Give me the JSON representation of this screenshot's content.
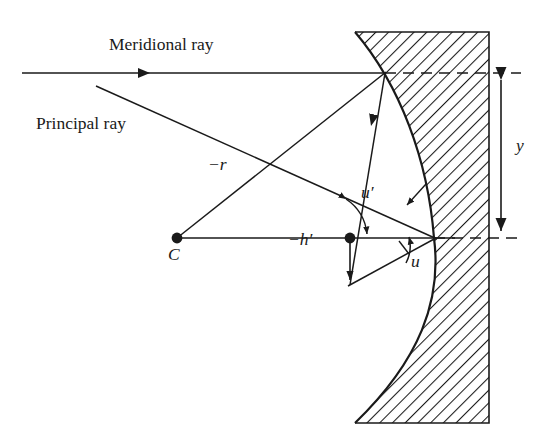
{
  "figure": {
    "domain_type": "optical ray diagram",
    "canvas": {
      "width": 550,
      "height": 445
    },
    "colors": {
      "ink": "#1a1a1a",
      "background": "#ffffff",
      "hatch": "#1a1a1a"
    }
  },
  "labels": {
    "meridional_ray": "Meridional ray",
    "principal_ray": "Principal ray",
    "radius": "−r",
    "object_height": "−h′",
    "angle_u_prime": "u′",
    "angle_u": "u",
    "center_of_curvature": "C",
    "ray_height": "y"
  },
  "geometry": {
    "optical_axis": {
      "x1": 177,
      "y1": 238,
      "x2": 455,
      "y2": 238
    },
    "meridional_ray_incoming": {
      "x1": 22,
      "y1": 73,
      "x2": 385,
      "y2": 73
    },
    "meridional_ray_arrowhead": {
      "x": 148,
      "y": 73,
      "direction": "right"
    },
    "meridional_reflected": {
      "x1": 385,
      "y1": 73,
      "x2": 350,
      "y2": 285
    },
    "meridional_reflected_arrowhead": {
      "x": 368,
      "y": 122,
      "direction": "down-left"
    },
    "principal_ray": {
      "x1": 96,
      "y1": 86,
      "x2": 434,
      "y2": 238
    },
    "radius_line": {
      "x1": 177,
      "y1": 238,
      "x2": 385,
      "y2": 73
    },
    "image_height_arrow": {
      "x1": 350,
      "y1": 238,
      "x2": 350,
      "y2": 285,
      "direction": "down"
    },
    "lower_ray": {
      "x1": 350,
      "y1": 285,
      "x2": 434,
      "y2": 238
    },
    "vertex": {
      "x": 434,
      "y": 238
    },
    "center_point": {
      "x": 177,
      "y": 238
    },
    "image_point": {
      "x": 350,
      "y": 238
    },
    "surface_hit_point": {
      "x": 385,
      "y": 73
    },
    "y_dimension": {
      "x": 501,
      "y_top": 73,
      "y_bottom": 238
    },
    "dashed_upper": {
      "x1": 385,
      "y1": 73,
      "x2": 520,
      "y2": 73
    },
    "dashed_lower": {
      "x1": 434,
      "y1": 238,
      "x2": 520,
      "y2": 238
    },
    "glass_block": {
      "left_top_x": 355,
      "right_x": 489,
      "top_y": 32,
      "bottom_y": 423
    },
    "curve_control": {
      "bulge_x": 434
    }
  },
  "label_positions": {
    "meridional_ray": {
      "x": 109,
      "y": 45
    },
    "principal_ray": {
      "x": 36,
      "y": 124
    },
    "radius": {
      "x": 208,
      "y": 165
    },
    "object_height": {
      "x": 291,
      "y": 230
    },
    "angle_u_prime": {
      "x": 360,
      "y": 193
    },
    "angle_u": {
      "x": 411,
      "y": 260
    },
    "center_of_curvature": {
      "x": 165,
      "y": 245
    },
    "ray_height": {
      "x": 518,
      "y": 145
    }
  },
  "annotations": {
    "arc_u_prime": "double-headed arc between principal ray and reflected meridional ray",
    "arc_u": "arc between optical axis and lower ray at vertex",
    "leader_u_prime": "short leader arrow pointing down-left toward principal ray",
    "leader_u": "short leader arrow pointing up-left toward lower ray",
    "hatching": "45-degree diagonal hatch fill indicating glass medium"
  }
}
